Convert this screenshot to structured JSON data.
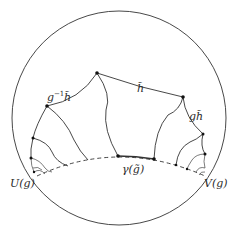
{
  "diagram": {
    "boundary_circle": {
      "cx": 119,
      "cy": 118,
      "r": 107
    },
    "labels": {
      "h_tilde": "h̃",
      "g_inverse_prefix": "g",
      "g_inverse_exp": "−1",
      "g_inverse_h": "h̃",
      "g_h": "gh̃",
      "gamma": "γ(g̃)",
      "U": "U(g)",
      "V": "V(g)"
    },
    "nodes": [
      {
        "id": "top",
        "x": 97,
        "y": 73
      },
      {
        "id": "left-upper",
        "x": 47,
        "y": 106
      },
      {
        "id": "right-upper",
        "x": 183,
        "y": 97
      },
      {
        "id": "gamma-left",
        "x": 118,
        "y": 156
      },
      {
        "id": "gamma-right",
        "x": 154,
        "y": 159
      },
      {
        "id": "left-mid",
        "x": 33,
        "y": 138
      },
      {
        "id": "left-low",
        "x": 31,
        "y": 158
      },
      {
        "id": "right-mid",
        "x": 203,
        "y": 134
      },
      {
        "id": "right-low",
        "x": 205,
        "y": 154
      }
    ],
    "colors": {
      "line": "#333333",
      "background": "#ffffff"
    }
  }
}
